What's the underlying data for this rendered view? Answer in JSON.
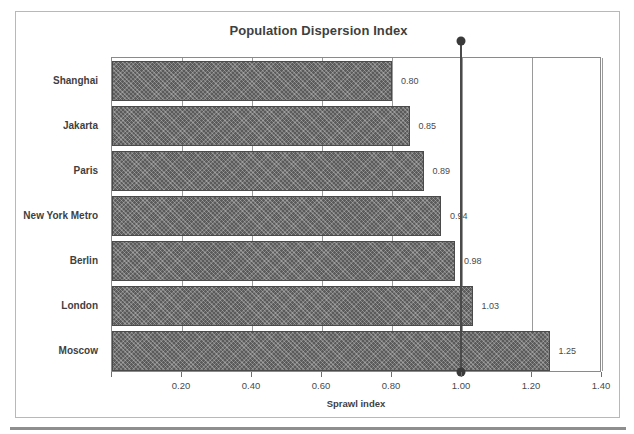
{
  "chart_data": {
    "type": "bar",
    "orientation": "horizontal",
    "title": "Population Dispersion Index",
    "xlabel": "Sprawl index",
    "ylabel": "",
    "categories": [
      "Shanghai",
      "Jakarta",
      "Paris",
      "New York Metro",
      "Berlin",
      "London",
      "Moscow"
    ],
    "values": [
      0.8,
      0.85,
      0.89,
      0.94,
      0.98,
      1.03,
      1.25
    ],
    "value_labels": [
      "0.80",
      "0.85",
      "0.89",
      "0.94",
      "0.98",
      "1.03",
      "1.25"
    ],
    "xlim": [
      0.0,
      1.4
    ],
    "xticks": [
      0.0,
      0.2,
      0.4,
      0.6,
      0.8,
      1.0,
      1.2,
      1.4
    ],
    "xtick_labels": [
      "",
      "0.20",
      "0.40",
      "0.60",
      "0.80",
      "1.00",
      "1.20",
      "1.40"
    ],
    "grid": true,
    "legend": false,
    "reference_line": {
      "value": 1.0,
      "label": "1.00",
      "has_top_marker": true,
      "has_bottom_marker": true
    },
    "colors": {
      "bar_fill": "#5b5b5b",
      "bar_edge": "#4a4a4a",
      "text": "#3f3f3f",
      "gridline": "#9a9a9a",
      "axis": "#8a8a8a",
      "reference_line": "#4a4a4a",
      "frame_border": "#b8b8b8",
      "background": "#ffffff"
    }
  }
}
